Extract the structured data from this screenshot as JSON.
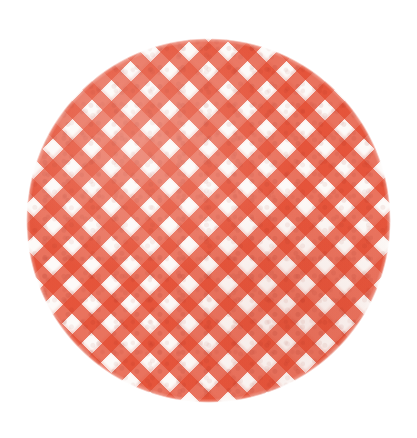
{
  "canvas": {
    "width_px": 417,
    "height_px": 438,
    "background_color": "#FFFFFF"
  },
  "artwork": {
    "subject": "circular gingham fabric swatch",
    "shape": "circle",
    "alt_text": "Round swatch of red and white gingham check fabric on a white background",
    "center_x_px": 208,
    "center_y_px": 220,
    "diameter_px": 365,
    "edge_style": "soft ragged cut edge"
  },
  "pattern": {
    "name": "gingham",
    "weave_angle_degrees": 45,
    "band_width_px": 13,
    "repeat_period_px": 27.5,
    "bands_per_axis_visible": 13,
    "tones": {
      "intersection": "#D9462F",
      "single_band": "#E8765E",
      "gap": "#FDFAF8"
    }
  },
  "colors": {
    "background": "#FFFFFF",
    "primary_red": "#E44B30",
    "deep_red": "#D9462F",
    "mid_salmon": "#E8765E",
    "cloth_white": "#FDFAF8"
  }
}
